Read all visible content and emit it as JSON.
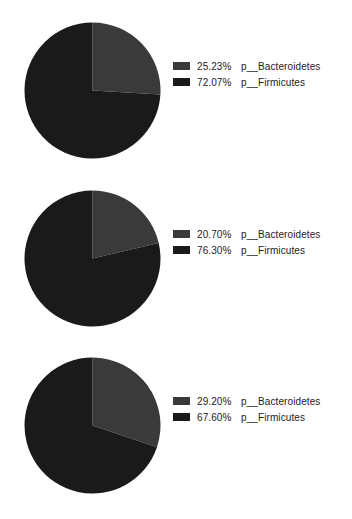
{
  "figure": {
    "background_color": "#ffffff",
    "series_colors": {
      "bacteroidetes": "#3a3a3a",
      "firmicutes": "#1a1a1a"
    }
  },
  "chart_data": [
    {
      "type": "pie",
      "title": "",
      "panel": 1,
      "labels": [
        "p__Bacteroidetes",
        "p__Firmicutes"
      ],
      "values": [
        25.23,
        72.07
      ],
      "value_labels": [
        "25.23%",
        "72.07%"
      ],
      "colors": [
        "#3a3a3a",
        "#1a1a1a"
      ],
      "legend_position": "right",
      "start_angle": 90,
      "direction": "clockwise"
    },
    {
      "type": "pie",
      "title": "",
      "panel": 2,
      "labels": [
        "p__Bacteroidetes",
        "p__Firmicutes"
      ],
      "values": [
        20.7,
        76.3
      ],
      "value_labels": [
        "20.70%",
        "76.30%"
      ],
      "colors": [
        "#3a3a3a",
        "#1a1a1a"
      ],
      "legend_position": "right",
      "start_angle": 90,
      "direction": "clockwise"
    },
    {
      "type": "pie",
      "title": "",
      "panel": 3,
      "labels": [
        "p__Bacteroidetes",
        "p__Firmicutes"
      ],
      "values": [
        29.2,
        67.6
      ],
      "value_labels": [
        "29.20%",
        "67.60%"
      ],
      "colors": [
        "#3a3a3a",
        "#1a1a1a"
      ],
      "legend_position": "right",
      "start_angle": 90,
      "direction": "clockwise"
    }
  ],
  "panels": [
    {
      "legend": [
        {
          "pct": "25.23%",
          "taxon": "p__Bacteroidetes",
          "color": "#3a3a3a"
        },
        {
          "pct": "72.07%",
          "taxon": "p__Firmicutes",
          "color": "#1a1a1a"
        }
      ]
    },
    {
      "legend": [
        {
          "pct": "20.70%",
          "taxon": "p__Bacteroidetes",
          "color": "#3a3a3a"
        },
        {
          "pct": "76.30%",
          "taxon": "p__Firmicutes",
          "color": "#1a1a1a"
        }
      ]
    },
    {
      "legend": [
        {
          "pct": "29.20%",
          "taxon": "p__Bacteroidetes",
          "color": "#3a3a3a"
        },
        {
          "pct": "67.60%",
          "taxon": "p__Firmicutes",
          "color": "#1a1a1a"
        }
      ]
    }
  ]
}
